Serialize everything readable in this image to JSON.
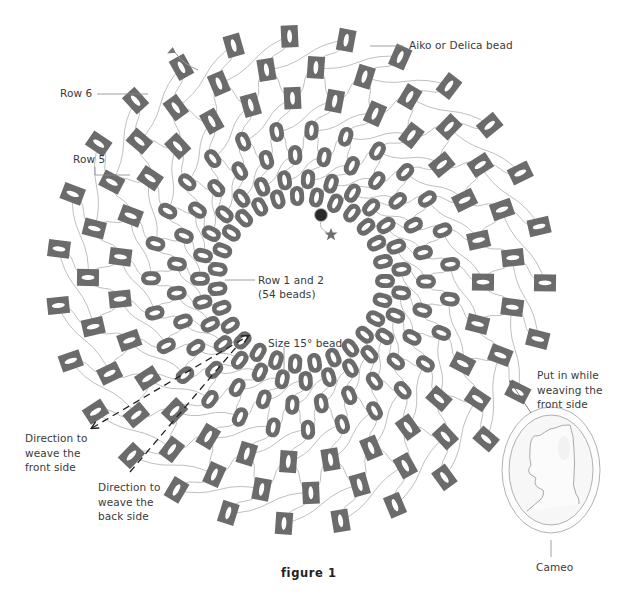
{
  "figure": {
    "caption": "figure 1",
    "colors": {
      "bead_fill": "#6b6b6b",
      "bead_hole": "#ffffff",
      "thread": "#b8b8b8",
      "leader_line": "#888888",
      "accent_bead": "#2a2a2a",
      "star": "#6e6e6e",
      "arrow": "#222222",
      "cameo_line": "#a8a8a8"
    }
  },
  "labels": {
    "aiko_bead": "Aiko or Delica bead",
    "row6": "Row 6",
    "row5": "Row 5",
    "row1_2_line1": "Row 1 and 2",
    "row1_2_line2": "(54 beads)",
    "size15_bead": "Size 15° bead",
    "direction_front": "Direction to\nweave the\nfront side",
    "direction_back": "Direction to\nweave the\nback side",
    "put_in": "Put in while\nweaving the\nfront side",
    "cameo": "Cameo"
  },
  "rings": [
    {
      "name": "row-1",
      "bead_type": "round",
      "count": 27,
      "offset": 0.5
    },
    {
      "name": "row-2",
      "bead_type": "round",
      "count": 27,
      "offset": 0
    },
    {
      "name": "row-3",
      "bead_type": "round",
      "count": 27,
      "offset": 0.5
    },
    {
      "name": "row-4",
      "bead_type": "round",
      "count": 27,
      "offset": 0
    },
    {
      "name": "row-5",
      "bead_type": "square",
      "count": 27,
      "offset": 0.5
    },
    {
      "name": "row-6",
      "bead_type": "square",
      "count": 27,
      "offset": 0
    },
    {
      "name": "row-7",
      "bead_type": "square",
      "count": 27,
      "offset": 0.5
    }
  ]
}
